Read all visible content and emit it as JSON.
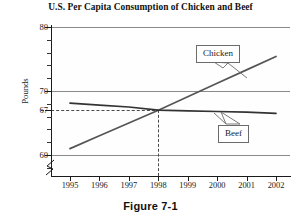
{
  "chart_data": {
    "type": "line",
    "title": "U.S. Per Capita Consumption of Chicken and Beef",
    "xlabel": "",
    "ylabel": "Pounds",
    "x": [
      1995,
      1996,
      1997,
      1998,
      1999,
      2000,
      2001,
      2002
    ],
    "xtick_labels": [
      "1995",
      "1996",
      "1997",
      "1998",
      "1999",
      "2000",
      "2001",
      "2002"
    ],
    "ytick_labels": [
      "80",
      "70",
      "67",
      "60"
    ],
    "ytick_values": [
      80,
      70,
      67,
      60
    ],
    "ylim": [
      57.5,
      80
    ],
    "xlim": [
      1994.6,
      2002.6
    ],
    "grid": "horizontal-major",
    "legend_position": "inline-callouts",
    "series": [
      {
        "name": "Chicken",
        "values": [
          61.0,
          63.0,
          65.0,
          67.0,
          69.1,
          71.2,
          73.3,
          75.4
        ],
        "color": "#555555"
      },
      {
        "name": "Beef",
        "values": [
          68.1,
          67.8,
          67.5,
          67.0,
          66.9,
          66.8,
          66.7,
          66.5
        ],
        "color": "#333333"
      }
    ],
    "annotations": [
      {
        "name": "intersection-guides",
        "x": 1998,
        "y": 67,
        "style": "dashed",
        "note": "67"
      }
    ]
  },
  "labels": {
    "chicken": "Chicken",
    "beef": "Beef"
  },
  "caption": {
    "text": "Figure 7-1"
  },
  "colors": {
    "axis": "#1a1a1a",
    "gridline": "#8a8a8a",
    "dashed_guide": "#4a4a4a",
    "chicken_line": "#555555",
    "beef_line": "#333333",
    "background": "#ffffff"
  }
}
